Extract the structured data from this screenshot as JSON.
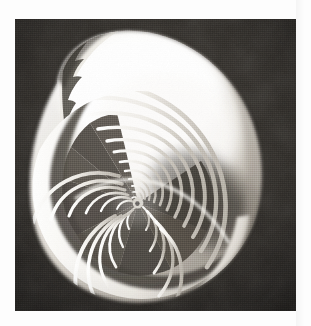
{
  "document": {
    "kind": "halftone-photograph",
    "medium": "black-and-white print reproduction",
    "subject_title": "Nautilus shell sectioned along the plane of coiling",
    "caption": "",
    "orientation": "portrait"
  },
  "canvas": {
    "width": 311,
    "height": 326,
    "paper_color": "#fdfdfd"
  },
  "photo": {
    "left": 15,
    "top": 19,
    "width": 281,
    "height": 292,
    "background_color": "#2b2825",
    "background_color_dark": "#201e1c",
    "background_color_light": "#3a3631",
    "shell_highlight_color": "#fbfbfa",
    "shell_midtone_color": "#b9b4ac",
    "shell_shadow_color": "#55504a",
    "septa_color": "#f3f1ec",
    "chamber_color": "#4a453f"
  },
  "subject": {
    "name": "nautilus-shell",
    "spiral_center_x": 123,
    "spiral_center_y": 184,
    "body_chamber_label": "body chamber",
    "septa_count": 17,
    "aperture_lip_label": "aperture lip",
    "spiral_type": "logarithmic",
    "growth_factor": 1.2
  },
  "chart_data": {
    "type": "scatter",
    "xlabel": "",
    "ylabel": "",
    "grid": false,
    "legend": "none",
    "note": "Radii of successive septa measured from the spiral centre, in pixels of the source print.",
    "categories": [
      "s1",
      "s2",
      "s3",
      "s4",
      "s5",
      "s6",
      "s7",
      "s8",
      "s9",
      "s10",
      "s11",
      "s12",
      "s13",
      "s14",
      "s15",
      "s16",
      "s17"
    ],
    "values": [
      5,
      6,
      8,
      9,
      11,
      13,
      16,
      19,
      23,
      28,
      33,
      40,
      48,
      58,
      69,
      83,
      100
    ]
  }
}
